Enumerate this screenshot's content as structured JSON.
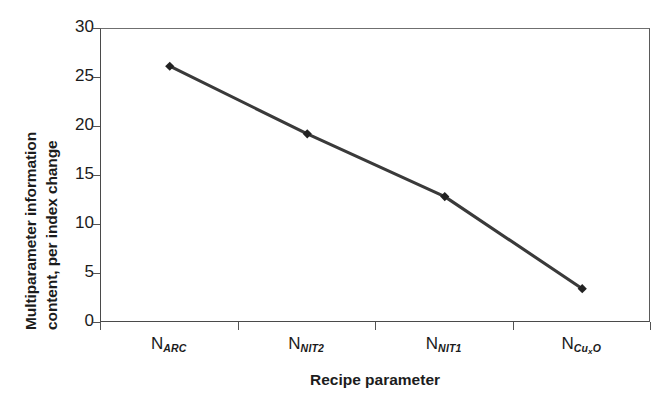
{
  "chart_data": {
    "type": "line",
    "title": "",
    "xlabel": "Recipe parameter",
    "ylabel_line1": "Multiparameter information",
    "ylabel_line2": "content, per index change",
    "categories": [
      "N_ARC",
      "N_NIT2",
      "N_NIT1",
      "N_CuxO"
    ],
    "category_labels": [
      {
        "base": "N",
        "sub": "ARC",
        "subsub": "",
        "subtail": ""
      },
      {
        "base": "N",
        "sub": "NIT2",
        "subsub": "",
        "subtail": ""
      },
      {
        "base": "N",
        "sub": "NIT1",
        "subsub": "",
        "subtail": ""
      },
      {
        "base": "N",
        "sub": "Cu",
        "subsub": "x",
        "subtail": "O"
      }
    ],
    "values": [
      26.2,
      19.3,
      12.9,
      3.5
    ],
    "series": [
      {
        "name": "Multiparameter information content",
        "values": [
          26.2,
          19.3,
          12.9,
          3.5
        ]
      }
    ],
    "ylim": [
      0,
      30
    ],
    "yticks": [
      0,
      5,
      10,
      15,
      20,
      25,
      30
    ],
    "ytick_labels": [
      "0",
      "5",
      "10",
      "15",
      "20",
      "25",
      "30"
    ],
    "grid": false,
    "legend": "none",
    "marker": "diamond",
    "line_color": "#3a3a3a",
    "marker_color": "#222222",
    "axis_color": "#4a4a4a",
    "background_color": "#ffffff"
  }
}
